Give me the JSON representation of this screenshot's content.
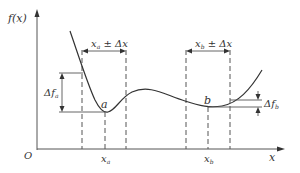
{
  "diagram": {
    "y_axis_label": "f(x)",
    "x_axis_label": "x",
    "origin_label": "O",
    "point_a_label": "a",
    "point_b_label": "b",
    "xa_tick_label": "x",
    "xa_tick_sub": "a",
    "xb_tick_label": "x",
    "xb_tick_sub": "b",
    "interval_a": {
      "main": "x",
      "sub": "a",
      "rest": " ± Δx"
    },
    "interval_b": {
      "main": "x",
      "sub": "b",
      "rest": " ± Δx"
    },
    "delta_fa": {
      "main": "Δf",
      "sub": "a"
    },
    "delta_fb": {
      "main": "Δf",
      "sub": "b"
    },
    "colors": {
      "line": "#333333",
      "axis": "#555555",
      "background": "#ffffff"
    }
  }
}
